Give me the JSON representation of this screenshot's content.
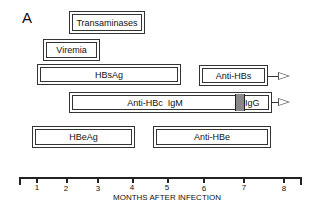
{
  "figure": {
    "panel_label": "A",
    "bars": [
      {
        "id": "transaminases",
        "label": "Transaminases"
      },
      {
        "id": "viremia",
        "label": "Viremia"
      },
      {
        "id": "hbsag",
        "label": "HBsAg"
      },
      {
        "id": "anti-hbs",
        "label": "Anti-HBs",
        "continues": true
      },
      {
        "id": "anti-hbc",
        "label": "Anti-HBc  IgM",
        "switch_label": "IgG",
        "continues": true
      },
      {
        "id": "hbeag",
        "label": "HBeAg"
      },
      {
        "id": "anti-hbe",
        "label": "Anti-HBe"
      }
    ],
    "axis": {
      "title": "MONTHS AFTER INFECTION",
      "ticks": [
        "1",
        "2",
        "3",
        "4",
        "5",
        "6",
        "7",
        "8"
      ]
    },
    "colors": {
      "line": "#333333",
      "switch_fill": "#888888",
      "background": "#ffffff"
    }
  }
}
